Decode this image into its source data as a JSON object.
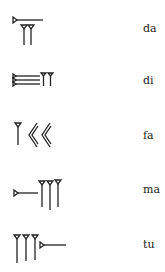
{
  "table": {
    "rows": [
      {
        "sign": "da-sign",
        "label": "da"
      },
      {
        "sign": "di-sign",
        "label": "di"
      },
      {
        "sign": "fa-sign",
        "label": "fa"
      },
      {
        "sign": "ma-sign",
        "label": "ma"
      },
      {
        "sign": "tu-sign",
        "label": "tu"
      }
    ]
  },
  "colors": {
    "ink": "#222222",
    "background": "#ffffff"
  }
}
